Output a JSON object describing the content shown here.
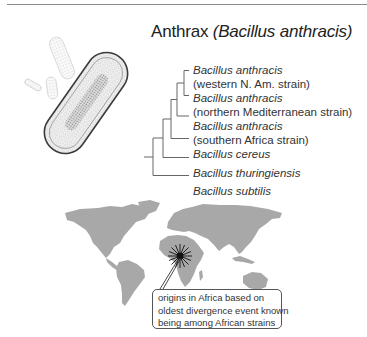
{
  "title": {
    "common": "Anthrax",
    "scientific": "(Bacillus anthracis)"
  },
  "tree": {
    "leaves": [
      {
        "species": "Bacillus anthracis",
        "strain": "(western N. Am. strain)"
      },
      {
        "species": "Bacillus anthracis",
        "strain": "(northern Mediterranean strain)"
      },
      {
        "species": "Bacillus anthracis",
        "strain": "(southern Africa strain)"
      },
      {
        "species": "Bacillus cereus",
        "strain": ""
      },
      {
        "species": "Bacillus thuringiensis",
        "strain": ""
      },
      {
        "species": "Bacillus subtilis",
        "strain": ""
      }
    ]
  },
  "illustration": {
    "subject": "Bacillus anthracis bacterium drawing"
  },
  "map": {
    "marker": "origin-starburst in central Africa",
    "callout": {
      "lines": [
        "origins in Africa based on",
        "oldest divergence event known",
        "being among African strains"
      ]
    }
  },
  "colors": {
    "land": "#a8a8a8",
    "lines": "#555555",
    "marker": "#111111"
  }
}
